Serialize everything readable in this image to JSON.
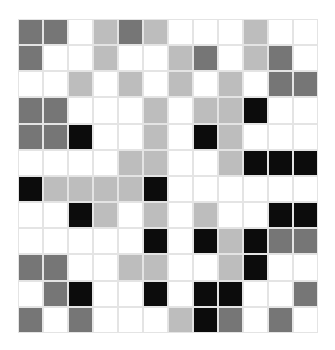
{
  "board": {
    "rows": 12,
    "cols": 12,
    "legend": {
      "W": {
        "name": "empty",
        "color": "#ffffff"
      },
      "L": {
        "name": "light-gray",
        "color": "#bdbdbd"
      },
      "D": {
        "name": "dark-gray",
        "color": "#767676"
      },
      "K": {
        "name": "black",
        "color": "#0c0c0c"
      }
    },
    "grid": [
      [
        "D",
        "D",
        "W",
        "L",
        "D",
        "L",
        "W",
        "W",
        "W",
        "L",
        "W",
        "W"
      ],
      [
        "D",
        "W",
        "W",
        "L",
        "W",
        "W",
        "L",
        "D",
        "W",
        "L",
        "D",
        "W"
      ],
      [
        "W",
        "W",
        "L",
        "W",
        "L",
        "W",
        "L",
        "W",
        "L",
        "W",
        "D",
        "D"
      ],
      [
        "D",
        "D",
        "W",
        "W",
        "W",
        "L",
        "W",
        "L",
        "L",
        "K",
        "W",
        "W"
      ],
      [
        "D",
        "D",
        "K",
        "W",
        "W",
        "L",
        "W",
        "K",
        "L",
        "W",
        "W",
        "W"
      ],
      [
        "W",
        "W",
        "W",
        "W",
        "L",
        "L",
        "W",
        "W",
        "L",
        "K",
        "K",
        "K"
      ],
      [
        "K",
        "L",
        "L",
        "L",
        "L",
        "K",
        "W",
        "W",
        "W",
        "W",
        "W",
        "W"
      ],
      [
        "W",
        "W",
        "K",
        "L",
        "W",
        "L",
        "W",
        "L",
        "W",
        "W",
        "K",
        "K"
      ],
      [
        "W",
        "W",
        "W",
        "W",
        "W",
        "K",
        "W",
        "K",
        "L",
        "K",
        "D",
        "D"
      ],
      [
        "D",
        "D",
        "W",
        "W",
        "L",
        "L",
        "W",
        "W",
        "L",
        "K",
        "W",
        "W"
      ],
      [
        "W",
        "D",
        "K",
        "W",
        "W",
        "K",
        "W",
        "K",
        "K",
        "W",
        "W",
        "D"
      ],
      [
        "D",
        "W",
        "D",
        "W",
        "W",
        "W",
        "L",
        "K",
        "D",
        "W",
        "D",
        "W"
      ]
    ]
  }
}
